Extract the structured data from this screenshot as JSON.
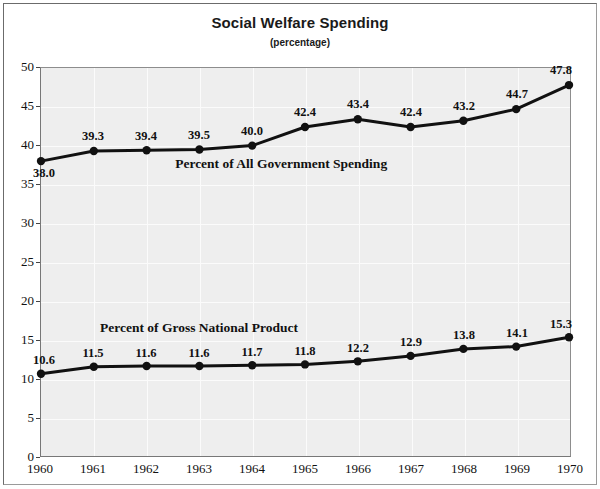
{
  "chart_data": {
    "type": "line",
    "title": "Social Welfare Spending",
    "subtitle": "(percentage)",
    "xlabel": "",
    "ylabel": "",
    "x": [
      1960,
      1961,
      1962,
      1963,
      1964,
      1965,
      1966,
      1967,
      1968,
      1969,
      1970
    ],
    "categories": [
      "1960",
      "1961",
      "1962",
      "1963",
      "1964",
      "1965",
      "1966",
      "1967",
      "1968",
      "1969",
      "1970"
    ],
    "ylim": [
      0,
      50
    ],
    "yticks": [
      0,
      5,
      10,
      15,
      20,
      25,
      30,
      35,
      40,
      45,
      50
    ],
    "ytick_labels": [
      "0",
      "5",
      "10",
      "15",
      "20",
      "25",
      "30",
      "35",
      "40",
      "45",
      "50"
    ],
    "grid": true,
    "legend_position": "inline-annotation",
    "series": [
      {
        "name": "Percent of All Government Spending",
        "values": [
          38.0,
          39.3,
          39.4,
          39.5,
          40.0,
          42.4,
          43.4,
          42.4,
          43.2,
          44.7,
          47.8
        ],
        "value_labels": [
          "38.0",
          "39.3",
          "39.4",
          "39.5",
          "40.0",
          "42.4",
          "43.4",
          "42.4",
          "43.2",
          "44.7",
          "47.8"
        ],
        "label_positions": [
          "below",
          "above",
          "above",
          "above",
          "above",
          "above",
          "above",
          "above",
          "above",
          "above",
          "above"
        ],
        "color": "#111111",
        "annotation": "Percent of All Government Spending",
        "annotation_x": 1964.55,
        "annotation_y": 37.6
      },
      {
        "name": "Percent of Gross National Product",
        "values": [
          10.6,
          11.5,
          11.6,
          11.6,
          11.7,
          11.8,
          12.2,
          12.9,
          13.8,
          14.1,
          15.3
        ],
        "value_labels": [
          "10.6",
          "11.5",
          "11.6",
          "11.6",
          "11.7",
          "11.8",
          "12.2",
          "12.9",
          "13.8",
          "14.1",
          "15.3"
        ],
        "label_positions": [
          "above",
          "above",
          "above",
          "above",
          "above",
          "above",
          "above",
          "above",
          "above",
          "above",
          "above"
        ],
        "color": "#111111",
        "annotation": "Percent of Gross National Product",
        "annotation_x": 1963.0,
        "annotation_y": 16.6
      }
    ],
    "colors": {
      "line": "#111111",
      "marker": "#111111",
      "plot_background": "#eeeeee",
      "gridline": "#fbfbfb",
      "axis": "#777777",
      "text": "#111111",
      "page_background": "#ffffff"
    }
  }
}
